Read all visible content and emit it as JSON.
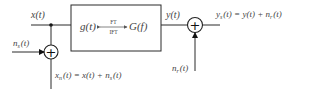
{
  "diagram": {
    "type": "block-diagram",
    "input_signal": {
      "label": "x(t)"
    },
    "input_noise": {
      "label": "n",
      "sub": "s",
      "arg": "(t)"
    },
    "noisy_input": {
      "lhs": "x",
      "lhs_sub": "n",
      "rhs": "(t) = x(t) + n",
      "rhs_sub": "s",
      "tail": "(t)"
    },
    "system_block": {
      "left": "g(t)",
      "right": "G(f)",
      "arrow_top": "FT",
      "arrow_bottom": "IFT"
    },
    "output_signal": {
      "label": "y(t)"
    },
    "output_noise": {
      "label": "n",
      "sub": "r",
      "arg": "(t)"
    },
    "noisy_output": {
      "lhs": "y",
      "lhs_sub": "s",
      "rhs": "(t) = y(t) + n",
      "rhs_sub": "r",
      "tail": "(t)"
    },
    "summing_junction_symbol": "+",
    "colors": {
      "stroke": "#2a2a2a",
      "text": "#444444",
      "background": "#ffffff"
    }
  }
}
